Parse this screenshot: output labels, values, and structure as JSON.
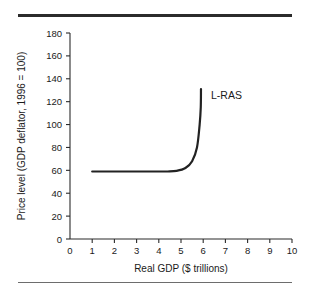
{
  "chart_data": {
    "type": "line",
    "title": "",
    "xlabel": "Real GDP ($ trillions)",
    "ylabel": "Price level (GDP deflator, 1996 = 100)",
    "xlim": [
      0,
      10
    ],
    "ylim": [
      0,
      180
    ],
    "xticks": [
      "0",
      "1",
      "2",
      "3",
      "4",
      "5",
      "6",
      "7",
      "8",
      "9",
      "10"
    ],
    "yticks": [
      "0",
      "20",
      "40",
      "60",
      "80",
      "100",
      "120",
      "140",
      "160",
      "180"
    ],
    "grid": false,
    "legend_position": "inline-annotation",
    "series": [
      {
        "name": "L-RAS",
        "label": "L-RAS",
        "points": [
          [
            1.0,
            59
          ],
          [
            2.0,
            59
          ],
          [
            3.0,
            59
          ],
          [
            4.0,
            59
          ],
          [
            4.4,
            59
          ],
          [
            4.8,
            59.5
          ],
          [
            5.2,
            62
          ],
          [
            5.5,
            68
          ],
          [
            5.72,
            80
          ],
          [
            5.84,
            100
          ],
          [
            5.89,
            115
          ],
          [
            5.9,
            131
          ]
        ]
      }
    ],
    "annotations": [
      {
        "text": "L-RAS",
        "x": 6.35,
        "y": 122
      }
    ]
  },
  "figure": {
    "rule_top_label": "top-divider-rule",
    "rule_bottom_label": "bottom-divider-rule"
  },
  "colors": {
    "background": "#ffffff",
    "axis": "#2b2b2b",
    "curve": "#222222",
    "rule_top": "#2b2b2b",
    "rule_bottom": "#6d6d6d",
    "text": "#1a1a1a"
  }
}
